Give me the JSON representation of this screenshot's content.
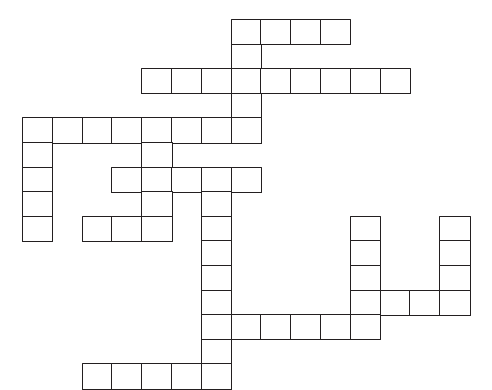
{
  "puzzle": {
    "title": "Crossword Puzzle Grid",
    "kind": "blank-crossword-grid",
    "image_width": 492,
    "image_height": 384,
    "background_color": "#ffffff",
    "line_color": "#231f20",
    "line_width_px": 1.6,
    "cell_width_px": 29.8,
    "cell_height_px": 24.6,
    "origin_x_px": 22,
    "origin_y_px": 19,
    "columns": 16,
    "rows": 15,
    "cell_count": 63,
    "filled_letters": "",
    "clue_numbers_shown": "none",
    "cells": [
      {
        "col": 7,
        "row": 0
      },
      {
        "col": 8,
        "row": 0
      },
      {
        "col": 9,
        "row": 0
      },
      {
        "col": 10,
        "row": 0
      },
      {
        "col": 7,
        "row": 1
      },
      {
        "col": 4,
        "row": 2
      },
      {
        "col": 5,
        "row": 2
      },
      {
        "col": 6,
        "row": 2
      },
      {
        "col": 7,
        "row": 2
      },
      {
        "col": 8,
        "row": 2
      },
      {
        "col": 9,
        "row": 2
      },
      {
        "col": 10,
        "row": 2
      },
      {
        "col": 11,
        "row": 2
      },
      {
        "col": 12,
        "row": 2
      },
      {
        "col": 7,
        "row": 3
      },
      {
        "col": 0,
        "row": 4
      },
      {
        "col": 1,
        "row": 4
      },
      {
        "col": 2,
        "row": 4
      },
      {
        "col": 3,
        "row": 4
      },
      {
        "col": 4,
        "row": 4
      },
      {
        "col": 5,
        "row": 4
      },
      {
        "col": 6,
        "row": 4
      },
      {
        "col": 7,
        "row": 4
      },
      {
        "col": 0,
        "row": 5
      },
      {
        "col": 4,
        "row": 5
      },
      {
        "col": 0,
        "row": 6
      },
      {
        "col": 3,
        "row": 6
      },
      {
        "col": 4,
        "row": 6
      },
      {
        "col": 5,
        "row": 6
      },
      {
        "col": 6,
        "row": 6
      },
      {
        "col": 7,
        "row": 6
      },
      {
        "col": 0,
        "row": 7
      },
      {
        "col": 4,
        "row": 7
      },
      {
        "col": 6,
        "row": 7
      },
      {
        "col": 0,
        "row": 8
      },
      {
        "col": 2,
        "row": 8
      },
      {
        "col": 3,
        "row": 8
      },
      {
        "col": 4,
        "row": 8
      },
      {
        "col": 6,
        "row": 8
      },
      {
        "col": 11,
        "row": 8
      },
      {
        "col": 14,
        "row": 8
      },
      {
        "col": 6,
        "row": 9
      },
      {
        "col": 11,
        "row": 9
      },
      {
        "col": 14,
        "row": 9
      },
      {
        "col": 6,
        "row": 10
      },
      {
        "col": 11,
        "row": 10
      },
      {
        "col": 14,
        "row": 10
      },
      {
        "col": 6,
        "row": 11
      },
      {
        "col": 11,
        "row": 11
      },
      {
        "col": 12,
        "row": 11
      },
      {
        "col": 13,
        "row": 11
      },
      {
        "col": 14,
        "row": 11
      },
      {
        "col": 6,
        "row": 12
      },
      {
        "col": 7,
        "row": 12
      },
      {
        "col": 8,
        "row": 12
      },
      {
        "col": 9,
        "row": 12
      },
      {
        "col": 10,
        "row": 12
      },
      {
        "col": 11,
        "row": 12
      },
      {
        "col": 6,
        "row": 13
      },
      {
        "col": 2,
        "row": 14
      },
      {
        "col": 3,
        "row": 14
      },
      {
        "col": 4,
        "row": 14
      },
      {
        "col": 5,
        "row": 14
      },
      {
        "col": 6,
        "row": 14
      }
    ]
  }
}
